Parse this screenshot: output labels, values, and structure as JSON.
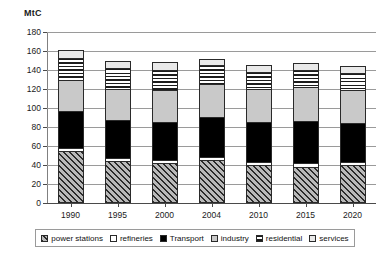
{
  "chart_data": {
    "type": "bar",
    "stacked": true,
    "title": "",
    "subtitle": "",
    "xlabel": "",
    "ylabel": "MtC",
    "ylim": [
      0,
      180
    ],
    "ytick_step": 20,
    "yticks": [
      0,
      20,
      40,
      60,
      80,
      100,
      120,
      140,
      160,
      180
    ],
    "grid": true,
    "legend_position": "bottom",
    "categories": [
      "1990",
      "1995",
      "2000",
      "2004",
      "2010",
      "2015",
      "2020"
    ],
    "series": [
      {
        "name": "power stations",
        "values": [
          55,
          44,
          42,
          45,
          40,
          38,
          40
        ]
      },
      {
        "name": "refineries",
        "values": [
          3,
          3,
          3,
          3,
          3,
          4,
          3
        ]
      },
      {
        "name": "Transport",
        "values": [
          39,
          40,
          40,
          43,
          42,
          44,
          41
        ]
      },
      {
        "name": "industry",
        "values": [
          33,
          33,
          34,
          34,
          35,
          36,
          35
        ]
      },
      {
        "name": "residential",
        "values": [
          23,
          22,
          21,
          20,
          18,
          18,
          18
        ]
      },
      {
        "name": "services",
        "values": [
          8,
          7,
          8,
          7,
          7,
          7,
          7
        ]
      }
    ],
    "totals": [
      161,
      149,
      148,
      152,
      145,
      147,
      144
    ]
  },
  "legend": {
    "items": [
      {
        "label": "power stations",
        "pattern": "diagonal-hatch"
      },
      {
        "label": "refineries",
        "pattern": "solid-white"
      },
      {
        "label": "Transport",
        "pattern": "solid-black"
      },
      {
        "label": "industry",
        "pattern": "solid-light-gray"
      },
      {
        "label": "residential",
        "pattern": "horizontal-stripes"
      },
      {
        "label": "services",
        "pattern": "solid-very-light-gray"
      }
    ]
  },
  "colors": {
    "power_stations": "#8a8a8a",
    "refineries": "#ffffff",
    "transport": "#000000",
    "industry": "#c9c9c9",
    "residential": "#ffffff",
    "services": "#e9e9e9",
    "grid": "#9a9a9a",
    "axis": "#4a4a4a",
    "text": "#1a1a1a"
  }
}
